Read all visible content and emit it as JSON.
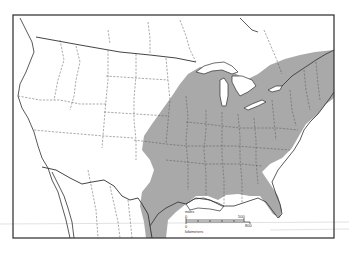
{
  "map": {
    "title": "",
    "region": "United States and northern Mexico",
    "shaded_region": "Eastern North America distribution range",
    "colors": {
      "frame": "#3a3a3a",
      "range_fill": "#a9a9a9",
      "background": "#ffffff",
      "lines": "#2f2f2f"
    },
    "scale_bar": {
      "miles_label": "miles",
      "miles_start": "0",
      "miles_end": "500",
      "km_label": "kilometers",
      "km_start": "0",
      "km_end": "800"
    }
  }
}
